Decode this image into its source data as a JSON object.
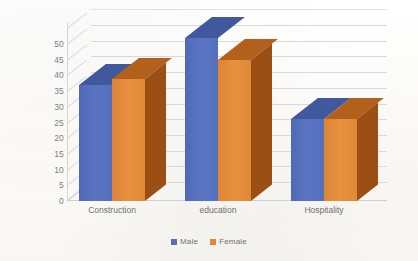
{
  "chart_data": {
    "type": "bar",
    "title": "",
    "subtitle": "",
    "xlabel": "",
    "ylabel": "",
    "categories": [
      "Construction",
      "education",
      "Hospitality"
    ],
    "series": [
      {
        "name": "Male",
        "color": "#5470bd",
        "values": [
          37,
          52,
          26
        ]
      },
      {
        "name": "Female",
        "color": "#e0893a",
        "values": [
          39,
          45,
          26
        ]
      }
    ],
    "ylim": [
      0,
      50
    ],
    "ytick_step": 5,
    "yticks": [
      "50",
      "45",
      "40",
      "35",
      "30",
      "25",
      "20",
      "15",
      "10",
      "5",
      "0"
    ],
    "grid": true,
    "grid_axis": "y",
    "legend_position": "bottom",
    "style": "3d-clustered-column",
    "legend": [
      {
        "label": "Male",
        "color": "#5470bd"
      },
      {
        "label": "Female",
        "color": "#e0893a"
      }
    ]
  },
  "colors": {
    "male": "#5470bd",
    "male_side": "#2f4687",
    "male_top": "#42589e",
    "female": "#e0893a",
    "female_side": "#9c4f15",
    "female_top": "#b4601d",
    "grid": "#d9d9d9",
    "axis_text": "#7f7f7f",
    "background": "#fdfdfb"
  }
}
